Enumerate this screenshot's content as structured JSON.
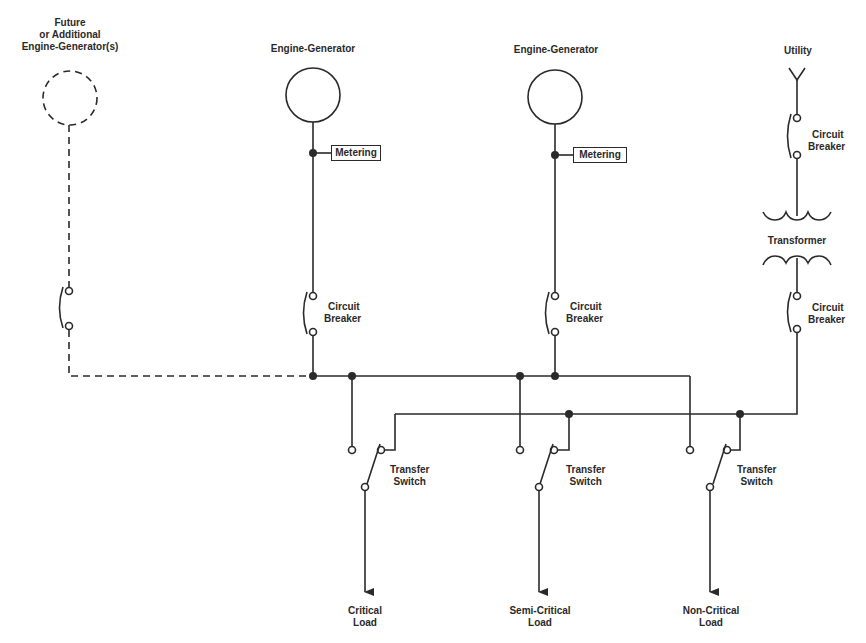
{
  "diagram": {
    "type": "one-line electrical distribution diagram",
    "colors": {
      "line": "#2a2a2a",
      "background": "#ffffff"
    },
    "sources": [
      {
        "id": "future_gen",
        "label": "Future\nor Additional\nEngine-Generator(s)",
        "label_lines": [
          "Future",
          "or Additional",
          "Engine-Generator(s)"
        ],
        "style": "dashed"
      },
      {
        "id": "gen1",
        "label": "Engine-Generator",
        "metering": "Metering",
        "breaker": [
          "Circuit",
          "Breaker"
        ]
      },
      {
        "id": "gen2",
        "label": "Engine-Generator",
        "metering": "Metering",
        "breaker": [
          "Circuit",
          "Breaker"
        ]
      },
      {
        "id": "utility",
        "label": "Utility",
        "breaker_top": [
          "Circuit",
          "Breaker"
        ],
        "transformer": "Transformer",
        "breaker_bottom": [
          "Circuit",
          "Breaker"
        ]
      }
    ],
    "transfer_switches": [
      {
        "label": [
          "Transfer",
          "Switch"
        ],
        "load": [
          "Critical",
          "Load"
        ]
      },
      {
        "label": [
          "Transfer",
          "Switch"
        ],
        "load": [
          "Semi-Critical",
          "Load"
        ]
      },
      {
        "label": [
          "Transfer",
          "Switch"
        ],
        "load": [
          "Non-Critical",
          "Load"
        ]
      }
    ]
  },
  "labels": {
    "future_l1": "Future",
    "future_l2": "or Additional",
    "future_l3": "Engine-Generator(s)",
    "gen1": "Engine-Generator",
    "gen2": "Engine-Generator",
    "utility": "Utility",
    "metering": "Metering",
    "cb_l1": "Circuit",
    "cb_l2": "Breaker",
    "transformer": "Transformer",
    "ts_l1": "Transfer",
    "ts_l2": "Switch",
    "load_critical": "Critical",
    "load_semi": "Semi-Critical",
    "load_non": "Non-Critical",
    "load_word": "Load"
  }
}
